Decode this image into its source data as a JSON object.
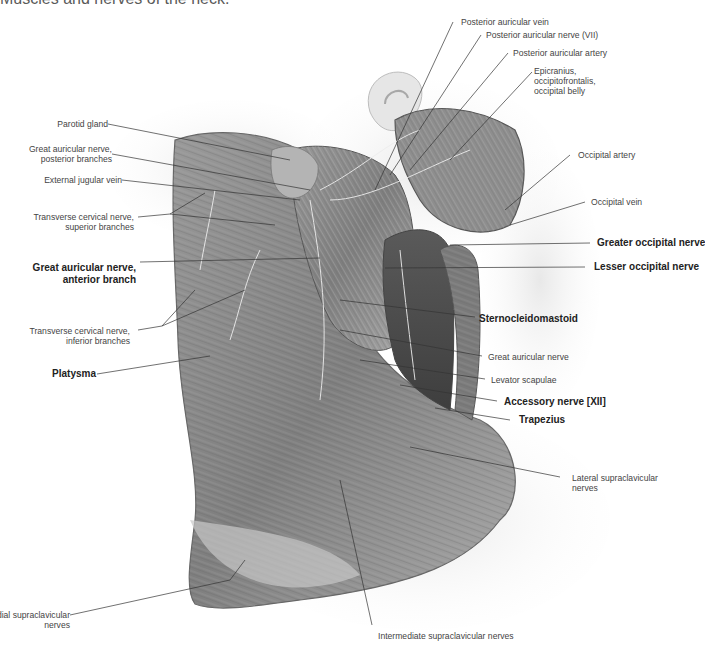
{
  "title": "Muscles and nerves of the neck.",
  "colors": {
    "background": "#ffffff",
    "label": "#444444",
    "label_bold": "#222222",
    "leader": "#333333",
    "skin": "#d9d9d9",
    "muscle": "#8a8a8a"
  },
  "labels_left": [
    {
      "id": "parotid",
      "text": "Parotid gland",
      "bold": false
    },
    {
      "id": "gan-post",
      "text": "Great auricular nerve,\nposterior branches",
      "bold": false
    },
    {
      "id": "ejv",
      "text": "External jugular vein",
      "bold": false
    },
    {
      "id": "tcn-sup",
      "text": "Transverse cervical nerve,\nsuperior branches",
      "bold": false
    },
    {
      "id": "gan-ant",
      "text": "Great auricular nerve,\nanterior branch",
      "bold": true
    },
    {
      "id": "tcn-inf",
      "text": "Transverse cervical nerve,\ninferior branches",
      "bold": false
    },
    {
      "id": "platysma",
      "text": "Platysma",
      "bold": true
    },
    {
      "id": "medial-supra",
      "text": "Medial supraclavicular\nnerves",
      "bold": false
    }
  ],
  "labels_right": [
    {
      "id": "pav",
      "text": "Posterior auricular vein",
      "bold": false
    },
    {
      "id": "pan",
      "text": "Posterior auricular nerve (VII)",
      "bold": false
    },
    {
      "id": "paa",
      "text": "Posterior auricular artery",
      "bold": false
    },
    {
      "id": "epicranius",
      "text": "Epicranius,\noccipitofrontalis,\noccipital belly",
      "bold": false
    },
    {
      "id": "occ-artery",
      "text": "Occipital artery",
      "bold": false
    },
    {
      "id": "occ-vein",
      "text": "Occipital vein",
      "bold": false
    },
    {
      "id": "gon",
      "text": "Greater occipital nerve",
      "bold": true
    },
    {
      "id": "lon",
      "text": "Lesser occipital nerve",
      "bold": true
    },
    {
      "id": "scm",
      "text": "Sternocleidomastoid",
      "bold": true
    },
    {
      "id": "gan",
      "text": "Great auricular nerve",
      "bold": false
    },
    {
      "id": "levator",
      "text": "Levator scapulae",
      "bold": false
    },
    {
      "id": "accessory",
      "text": "Accessory nerve [XII]",
      "bold": true
    },
    {
      "id": "trapezius",
      "text": "Trapezius",
      "bold": true
    },
    {
      "id": "lateral-supra",
      "text": "Lateral supraclavicular\nnerves",
      "bold": false
    }
  ],
  "labels_bottom": [
    {
      "id": "intermediate-supra",
      "text": "Intermediate supraclavicular nerves",
      "bold": false
    }
  ]
}
